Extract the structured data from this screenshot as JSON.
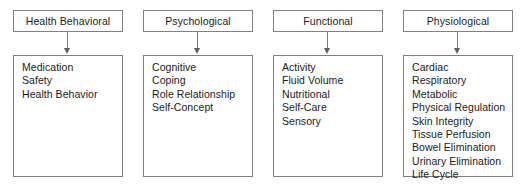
{
  "diagram": {
    "type": "hierarchy-columns",
    "columns": [
      {
        "header": "Health Behavioral",
        "items": [
          "Medication",
          "Safety",
          "Health Behavior"
        ]
      },
      {
        "header": "Psychological",
        "items": [
          "Cognitive",
          "Coping",
          "Role Relationship",
          "Self-Concept"
        ]
      },
      {
        "header": "Functional",
        "items": [
          "Activity",
          "Fluid Volume",
          "Nutritional",
          "Self-Care",
          "Sensory"
        ]
      },
      {
        "header": "Physiological",
        "items": [
          "Cardiac",
          "Respiratory",
          "Metabolic",
          "Physical Regulation",
          "Skin Integrity",
          "Tissue Perfusion",
          "Bowel Elimination",
          "Urinary Elimination",
          "Life Cycle"
        ]
      }
    ],
    "colors": {
      "background": "#ffffff",
      "border": "#808080",
      "text": "#1a1a1a",
      "connector": "#7a7a7a"
    }
  }
}
